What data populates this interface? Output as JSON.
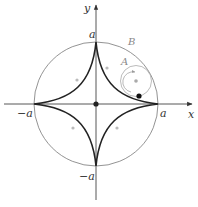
{
  "diagram": {
    "labels": {
      "y_axis": "y",
      "x_axis": "x",
      "top": "a",
      "bottom": "−a",
      "left": "−a",
      "right": "a",
      "big_circle": "B",
      "small_circle": "A"
    },
    "colors": {
      "astroid": "#222222",
      "axes": "#444444",
      "big_circle": "#777777",
      "small_circle": "#aaaaaa",
      "marker": "#bbbbbb"
    }
  }
}
